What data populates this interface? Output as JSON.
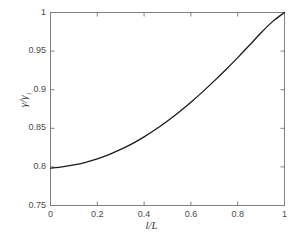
{
  "chart_data": {
    "type": "line",
    "title": "",
    "xlabel": "l/L",
    "ylabel": "γ/γ₁",
    "ylabel_base": "γ/γ",
    "ylabel_sub": "1",
    "xlim": [
      0,
      1
    ],
    "ylim": [
      0.75,
      1
    ],
    "grid": false,
    "legend": null,
    "xticks": [
      "0",
      "0.2",
      "0.4",
      "0.6",
      "0.8",
      "1"
    ],
    "xtick_values": [
      0,
      0.2,
      0.4,
      0.6,
      0.8,
      1
    ],
    "yticks": [
      "0.75",
      "0.8",
      "0.85",
      "0.9",
      "0.95",
      "1"
    ],
    "ytick_values": [
      0.75,
      0.8,
      0.85,
      0.9,
      0.95,
      1
    ],
    "series": [
      {
        "name": "gamma-ratio",
        "color": "#1a1a1a",
        "linewidth": 1.3,
        "x": [
          0.0,
          0.05,
          0.1,
          0.15,
          0.2,
          0.25,
          0.3,
          0.35,
          0.4,
          0.45,
          0.5,
          0.55,
          0.6,
          0.65,
          0.7,
          0.75,
          0.8,
          0.85,
          0.9,
          0.95,
          1.0
        ],
        "values": [
          0.7985,
          0.8,
          0.8025,
          0.806,
          0.8105,
          0.816,
          0.8226,
          0.8302,
          0.8389,
          0.8487,
          0.8595,
          0.8712,
          0.8838,
          0.8972,
          0.9114,
          0.9262,
          0.9416,
          0.9575,
          0.9738,
          0.9885,
          1.0
        ]
      }
    ]
  },
  "axes": {
    "line_color": "#808080",
    "tick_color": "#808080",
    "background": "#ffffff"
  }
}
